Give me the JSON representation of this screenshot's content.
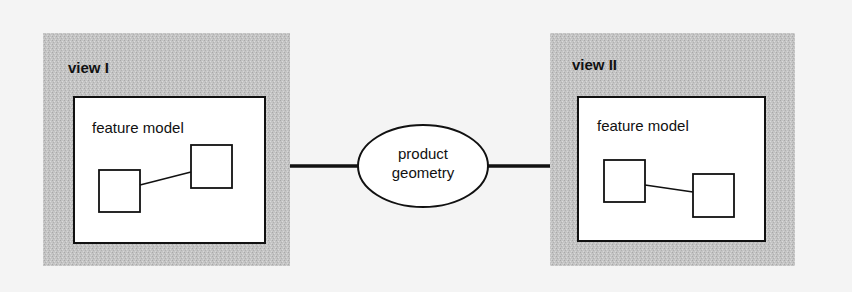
{
  "diagram": {
    "views": [
      {
        "label": "view I",
        "model_label": "feature model"
      },
      {
        "label": "view II",
        "model_label": "feature model"
      }
    ],
    "center_node": {
      "line1": "product",
      "line2": "geometry"
    }
  },
  "colors": {
    "background": "#f4f4f4",
    "panel": "#c9c9c9",
    "box_fill": "#ffffff",
    "stroke": "#111111"
  }
}
